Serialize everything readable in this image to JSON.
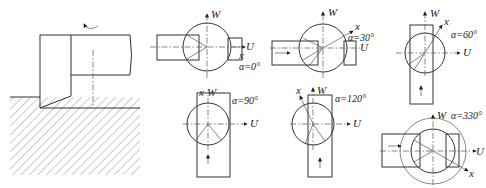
{
  "figure": {
    "axes": {
      "u_label": "U",
      "w_label": "W",
      "x_label": "x"
    },
    "panels": [
      {
        "id": "setup",
        "label": ""
      },
      {
        "id": "a0",
        "angle_label": "α=0°"
      },
      {
        "id": "a30",
        "angle_label": "α=30°"
      },
      {
        "id": "a60",
        "angle_label": "α=60°"
      },
      {
        "id": "a90",
        "angle_label": "α=90°"
      },
      {
        "id": "a120",
        "angle_label": "α=120°"
      },
      {
        "id": "a330",
        "angle_label": "α=330°"
      }
    ]
  }
}
